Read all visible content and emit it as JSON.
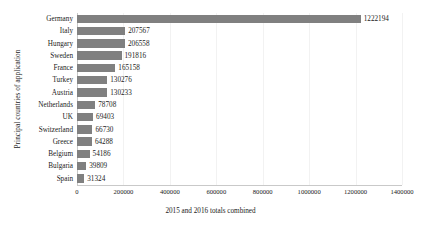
{
  "chart_data": {
    "type": "bar",
    "orientation": "horizontal",
    "title": "",
    "xlabel": "2015 and 2016 totals combined",
    "ylabel": "Principal countries of application",
    "xlim": [
      0,
      1400000
    ],
    "xticks": [
      "0",
      "200000",
      "400000",
      "600000",
      "800000",
      "1000000",
      "1200000",
      "1400000"
    ],
    "xtick_values": [
      0,
      200000,
      400000,
      600000,
      800000,
      1000000,
      1200000,
      1400000
    ],
    "grid": true,
    "legend": "none",
    "bar_color": "#808080",
    "categories": [
      "Spain",
      "Bulgaria",
      "Belgium",
      "Greece",
      "Switzerland",
      "UK",
      "Netherlands",
      "Austria",
      "Turkey",
      "France",
      "Sweden",
      "Hungary",
      "Italy",
      "Germany"
    ],
    "values": [
      31324,
      39809,
      54186,
      64288,
      66730,
      69403,
      78708,
      130233,
      130276,
      165158,
      191816,
      206558,
      207567,
      1222194
    ],
    "data_labels": [
      "31324",
      "39809",
      "54186",
      "64288",
      "66730",
      "69403",
      "78708",
      "130233",
      "130276",
      "165158",
      "191816",
      "206558",
      "207567",
      "1222194"
    ]
  }
}
